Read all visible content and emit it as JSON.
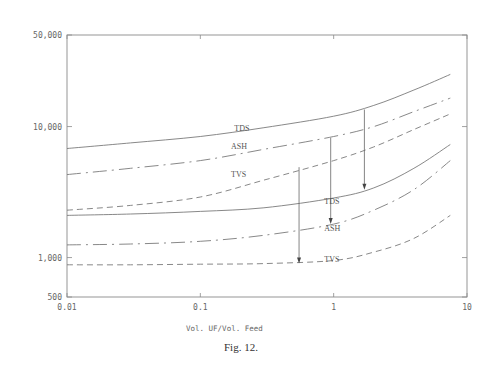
{
  "chart_data": {
    "type": "line",
    "title": "",
    "caption": "Fig. 12.",
    "xlabel": "Vol. UF/Vol. Feed",
    "ylabel": "",
    "xscale": "log",
    "yscale": "log",
    "xlim": [
      0.01,
      10
    ],
    "ylim": [
      500,
      50000
    ],
    "grid": false,
    "x_ticks": [
      0.01,
      0.1,
      1,
      10
    ],
    "x_tick_labels": [
      "0.01",
      "0.1",
      "1",
      "10"
    ],
    "y_ticks": [
      500,
      1000,
      10000,
      50000
    ],
    "y_tick_labels": [
      "500",
      "1,000",
      "10,000",
      "50,000"
    ],
    "legend": null,
    "x": [
      0.01,
      0.03,
      0.1,
      0.3,
      1,
      2,
      4,
      7.5
    ],
    "series": [
      {
        "name": "TDS",
        "group": "upper",
        "style": "solid",
        "values": [
          6800,
          7500,
          8400,
          9800,
          12000,
          14500,
          19000,
          25000
        ]
      },
      {
        "name": "ASH",
        "group": "upper",
        "style": "dashdot",
        "values": [
          4300,
          4800,
          5500,
          6700,
          8400,
          10000,
          13000,
          16500
        ]
      },
      {
        "name": "TVS",
        "group": "upper",
        "style": "dashed",
        "values": [
          2300,
          2500,
          2900,
          3900,
          5500,
          7000,
          9500,
          12500
        ]
      },
      {
        "name": "TDS",
        "group": "lower",
        "style": "solid",
        "values": [
          2100,
          2150,
          2250,
          2400,
          2850,
          3400,
          4800,
          7300
        ]
      },
      {
        "name": "ASH",
        "group": "lower",
        "style": "dashdot",
        "values": [
          1250,
          1270,
          1330,
          1480,
          1800,
          2300,
          3300,
          5500
        ]
      },
      {
        "name": "TVS",
        "group": "lower",
        "style": "dashed",
        "values": [
          880,
          880,
          890,
          900,
          950,
          1100,
          1400,
          2100
        ]
      }
    ],
    "annotations": [
      {
        "type": "arrow",
        "x": 0.55,
        "from": 4900,
        "to": 900,
        "note": "TVS upper to TVS lower"
      },
      {
        "type": "arrow",
        "x": 0.95,
        "from": 8200,
        "to": 1800,
        "note": "ASH upper to ASH lower"
      },
      {
        "type": "arrow",
        "x": 1.7,
        "from": 13500,
        "to": 3300,
        "note": "TDS upper to TDS lower"
      }
    ],
    "curve_labels": [
      {
        "text": "TDS",
        "x": 0.18,
        "y": 9300
      },
      {
        "text": "ASH",
        "x": 0.17,
        "y": 6700
      },
      {
        "text": "TVS",
        "x": 0.17,
        "y": 4100
      },
      {
        "text": "TDS",
        "x": 0.85,
        "y": 2550
      },
      {
        "text": "ASH",
        "x": 0.85,
        "y": 1600
      },
      {
        "text": "TVS",
        "x": 0.85,
        "y": 920
      }
    ]
  }
}
